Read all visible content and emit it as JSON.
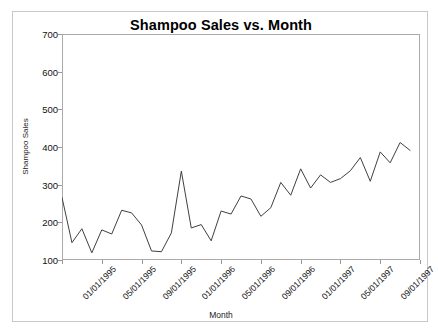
{
  "chart_data": {
    "type": "line",
    "title": "Shampoo Sales vs. Month",
    "xlabel": "Month",
    "ylabel": "Shampoo Sales",
    "ylim": [
      100,
      700
    ],
    "ytick_values": [
      100,
      200,
      300,
      400,
      500,
      600,
      700
    ],
    "ytick_labels": [
      "100",
      "200",
      "300",
      "400",
      "500",
      "600",
      "700"
    ],
    "xtick_labels": [
      "01/01/1995",
      "05/01/1995",
      "09/01/1995",
      "01/01/1996",
      "05/01/1996",
      "09/01/1996",
      "01/01/1997",
      "05/01/1997",
      "09/01/1997",
      "01/01/1998"
    ],
    "xtick_indices": [
      0,
      4,
      8,
      12,
      16,
      20,
      24,
      28,
      32,
      36
    ],
    "grid": false,
    "legend": false,
    "line_color": "#404040",
    "line_width": 1,
    "categories": [
      "01/01/1995",
      "02/01/1995",
      "03/01/1995",
      "04/01/1995",
      "05/01/1995",
      "06/01/1995",
      "07/01/1995",
      "08/01/1995",
      "09/01/1995",
      "10/01/1995",
      "11/01/1995",
      "12/01/1995",
      "01/01/1996",
      "02/01/1996",
      "03/01/1996",
      "04/01/1996",
      "05/01/1996",
      "06/01/1996",
      "07/01/1996",
      "08/01/1996",
      "09/01/1996",
      "10/01/1996",
      "11/01/1996",
      "12/01/1996",
      "01/01/1997",
      "02/01/1997",
      "03/01/1997",
      "04/01/1997",
      "05/01/1997",
      "06/01/1997",
      "07/01/1997",
      "08/01/1997",
      "09/01/1997",
      "10/01/1997",
      "11/01/1997",
      "12/01/1997"
    ],
    "values": [
      266,
      146,
      183,
      119,
      180,
      169,
      232,
      225,
      193,
      124,
      122,
      172,
      336,
      185,
      194,
      151,
      230,
      222,
      270,
      262,
      216,
      239,
      306,
      272,
      342,
      291,
      326,
      306,
      316,
      337,
      372,
      309,
      387,
      358,
      412,
      391
    ]
  },
  "figure": {
    "background_color": "#ffffff",
    "border_color": "#c8c8c8",
    "axis_color": "#aaaaaa"
  }
}
